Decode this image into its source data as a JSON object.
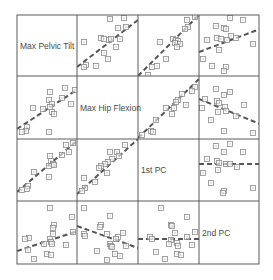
{
  "chart_data": {
    "type": "scatter-matrix",
    "title": "",
    "variables": [
      "Max Pelvic Tilt",
      "Max Hip Flexion",
      "1st PC",
      "2nd PC"
    ],
    "grid": {
      "x": [
        17,
        77,
        138,
        199,
        259
      ],
      "y": [
        15,
        76,
        139,
        201,
        264
      ]
    },
    "colors": {
      "frame": "#5a5a5a",
      "point": "#8a8a8a",
      "line": "#555555",
      "label": "#4a4a4a"
    },
    "marker": "square-with-dot",
    "fit_line_style": "dashed",
    "cells": [
      {
        "row": 0,
        "col": 1,
        "line": [
          [
            0,
            52
          ],
          [
            61,
            5
          ]
        ],
        "points": [
          [
            33,
            4
          ],
          [
            47,
            3
          ],
          [
            41,
            13
          ],
          [
            49,
            12
          ],
          [
            7,
            27
          ],
          [
            24,
            23
          ],
          [
            27,
            24
          ],
          [
            32,
            25
          ],
          [
            34,
            24
          ],
          [
            43,
            24
          ],
          [
            39,
            32
          ],
          [
            27,
            38
          ],
          [
            31,
            44
          ],
          [
            9,
            50
          ],
          [
            7,
            52
          ],
          [
            19,
            51
          ]
        ]
      },
      {
        "row": 0,
        "col": 2,
        "line": [
          [
            0,
            61
          ],
          [
            61,
            0
          ]
        ],
        "points": [
          [
            57,
            2
          ],
          [
            49,
            5
          ],
          [
            50,
            12
          ],
          [
            47,
            14
          ],
          [
            22,
            27
          ],
          [
            35,
            24
          ],
          [
            38,
            25
          ],
          [
            40,
            26
          ],
          [
            37,
            28
          ],
          [
            42,
            29
          ],
          [
            39,
            32
          ],
          [
            28,
            44
          ],
          [
            19,
            51
          ],
          [
            14,
            52
          ],
          [
            10,
            60
          ]
        ]
      },
      {
        "row": 0,
        "col": 3,
        "line": [
          [
            0,
            37
          ],
          [
            61,
            14
          ]
        ],
        "points": [
          [
            31,
            3
          ],
          [
            44,
            5
          ],
          [
            17,
            11
          ],
          [
            25,
            13
          ],
          [
            27,
            14
          ],
          [
            32,
            21
          ],
          [
            18,
            23
          ],
          [
            22,
            24
          ],
          [
            28,
            25
          ],
          [
            37,
            23
          ],
          [
            54,
            29
          ],
          [
            8,
            25
          ],
          [
            20,
            35
          ],
          [
            4,
            44
          ],
          [
            13,
            51
          ],
          [
            27,
            52
          ],
          [
            25,
            56
          ]
        ]
      },
      {
        "row": 1,
        "col": 0,
        "line": [
          [
            0,
            53
          ],
          [
            61,
            13
          ]
        ],
        "points": [
          [
            33,
            16
          ],
          [
            48,
            12
          ],
          [
            58,
            14
          ],
          [
            45,
            22
          ],
          [
            32,
            24
          ],
          [
            35,
            28
          ],
          [
            33,
            31
          ],
          [
            16,
            32
          ],
          [
            26,
            33
          ],
          [
            35,
            36
          ],
          [
            37,
            38
          ],
          [
            54,
            28
          ],
          [
            10,
            51
          ],
          [
            9,
            55
          ],
          [
            5,
            56
          ],
          [
            32,
            56
          ]
        ]
      },
      {
        "row": 1,
        "col": 2,
        "line": [
          [
            0,
            62
          ],
          [
            61,
            3
          ]
        ],
        "points": [
          [
            57,
            11
          ],
          [
            54,
            15
          ],
          [
            44,
            18
          ],
          [
            40,
            24
          ],
          [
            38,
            26
          ],
          [
            28,
            32
          ],
          [
            36,
            32
          ],
          [
            48,
            29
          ],
          [
            34,
            38
          ],
          [
            18,
            44
          ],
          [
            13,
            55
          ],
          [
            15,
            56
          ],
          [
            4,
            59
          ]
        ]
      },
      {
        "row": 1,
        "col": 3,
        "line": [
          [
            0,
            23
          ],
          [
            61,
            48
          ]
        ],
        "points": [
          [
            17,
            13
          ],
          [
            31,
            16
          ],
          [
            25,
            19
          ],
          [
            6,
            23
          ],
          [
            18,
            25
          ],
          [
            20,
            27
          ],
          [
            26,
            31
          ],
          [
            19,
            36
          ],
          [
            27,
            35
          ],
          [
            45,
            29
          ],
          [
            37,
            40
          ],
          [
            3,
            32
          ],
          [
            12,
            44
          ],
          [
            25,
            55
          ],
          [
            54,
            57
          ]
        ]
      },
      {
        "row": 2,
        "col": 0,
        "line": [
          [
            0,
            53
          ],
          [
            61,
            1
          ]
        ],
        "points": [
          [
            56,
            4
          ],
          [
            49,
            6
          ],
          [
            52,
            13
          ],
          [
            45,
            16
          ],
          [
            33,
            17
          ],
          [
            34,
            22
          ],
          [
            36,
            25
          ],
          [
            37,
            26
          ],
          [
            32,
            27
          ],
          [
            17,
            33
          ],
          [
            32,
            38
          ],
          [
            11,
            47
          ],
          [
            10,
            50
          ],
          [
            5,
            51
          ]
        ]
      },
      {
        "row": 2,
        "col": 1,
        "line": [
          [
            0,
            55
          ],
          [
            61,
            0
          ]
        ],
        "points": [
          [
            48,
            6
          ],
          [
            33,
            13
          ],
          [
            40,
            13
          ],
          [
            42,
            17
          ],
          [
            35,
            20
          ],
          [
            31,
            23
          ],
          [
            28,
            25
          ],
          [
            24,
            27
          ],
          [
            22,
            29
          ],
          [
            30,
            34
          ],
          [
            7,
            39
          ],
          [
            18,
            43
          ],
          [
            8,
            49
          ],
          [
            5,
            52
          ]
        ]
      },
      {
        "row": 2,
        "col": 3,
        "line": [
          [
            0,
            25
          ],
          [
            61,
            25
          ]
        ],
        "points": [
          [
            17,
            7
          ],
          [
            31,
            5
          ],
          [
            25,
            13
          ],
          [
            44,
            13
          ],
          [
            8,
            20
          ],
          [
            18,
            22
          ],
          [
            20,
            24
          ],
          [
            27,
            25
          ],
          [
            31,
            25
          ],
          [
            38,
            28
          ],
          [
            4,
            34
          ],
          [
            19,
            31
          ],
          [
            54,
            49
          ],
          [
            12,
            44
          ],
          [
            25,
            52
          ],
          [
            24,
            54
          ]
        ]
      },
      {
        "row": 3,
        "col": 0,
        "line": [
          [
            0,
            50
          ],
          [
            61,
            30
          ]
        ],
        "points": [
          [
            33,
            7
          ],
          [
            55,
            16
          ],
          [
            37,
            24
          ],
          [
            36,
            27
          ],
          [
            36,
            33
          ],
          [
            12,
            37
          ],
          [
            8,
            38
          ],
          [
            33,
            38
          ],
          [
            34,
            41
          ],
          [
            27,
            43
          ],
          [
            35,
            43
          ],
          [
            49,
            44
          ],
          [
            56,
            31
          ],
          [
            11,
            49
          ],
          [
            30,
            53
          ],
          [
            34,
            54
          ],
          [
            17,
            58
          ]
        ]
      },
      {
        "row": 3,
        "col": 1,
        "line": [
          [
            0,
            25
          ],
          [
            61,
            47
          ]
        ],
        "points": [
          [
            7,
            7
          ],
          [
            33,
            15
          ],
          [
            24,
            24
          ],
          [
            23,
            26
          ],
          [
            7,
            33
          ],
          [
            8,
            35
          ],
          [
            30,
            33
          ],
          [
            46,
            32
          ],
          [
            41,
            36
          ],
          [
            39,
            38
          ],
          [
            33,
            43
          ],
          [
            20,
            50
          ],
          [
            34,
            45
          ],
          [
            35,
            46
          ],
          [
            49,
            45
          ],
          [
            38,
            53
          ],
          [
            43,
            55
          ],
          [
            30,
            59
          ]
        ]
      },
      {
        "row": 3,
        "col": 2,
        "line": [
          [
            0,
            38
          ],
          [
            61,
            38
          ]
        ],
        "points": [
          [
            23,
            7
          ],
          [
            49,
            16
          ],
          [
            33,
            24
          ],
          [
            34,
            25
          ],
          [
            37,
            32
          ],
          [
            12,
            36
          ],
          [
            14,
            38
          ],
          [
            49,
            36
          ],
          [
            57,
            31
          ],
          [
            33,
            39
          ],
          [
            39,
            42
          ],
          [
            40,
            45
          ],
          [
            31,
            43
          ],
          [
            54,
            44
          ],
          [
            18,
            51
          ],
          [
            39,
            53
          ],
          [
            43,
            54
          ],
          [
            27,
            58
          ]
        ]
      }
    ],
    "xlabel": "",
    "ylabel": "",
    "grid_lines": false,
    "legend": null
  }
}
